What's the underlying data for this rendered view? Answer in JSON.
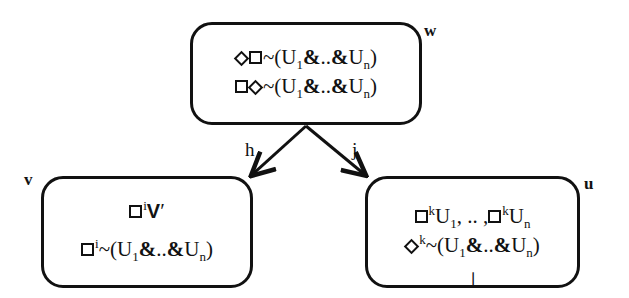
{
  "diagram": {
    "background": "#ffffff",
    "ink": "#111111",
    "nodes": [
      {
        "id": "w",
        "world_label": "w",
        "lines": [
          "◇□~(U1&..&Un)",
          "□◇~(U1&..&Un)"
        ]
      },
      {
        "id": "v",
        "world_label": "v",
        "lines": [
          "□iV′",
          "□i~(U1&..&Un)"
        ]
      },
      {
        "id": "u",
        "world_label": "u",
        "lines": [
          "□kU1, .. ,□kUn",
          "◇k~(U1&..&Un)",
          "⊥"
        ]
      }
    ],
    "edges": [
      {
        "id": "h",
        "label": "h",
        "from": "w",
        "to": "v"
      },
      {
        "id": "j",
        "label": "j",
        "from": "w",
        "to": "u"
      }
    ],
    "tokens": {
      "tilde": "~",
      "amp": "&",
      "ellipsis": "..",
      "comma_ellipsis": ", .. ,",
      "lparen": "(",
      "rparen": ")",
      "U": "U",
      "V": "V",
      "prime": "′",
      "sub_1": "1",
      "sub_n": "n",
      "sup_i": "i",
      "sup_k": "k",
      "falsum": "⊥"
    }
  }
}
